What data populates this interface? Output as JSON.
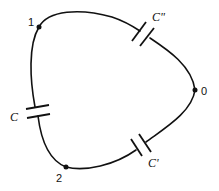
{
  "diagram": {
    "type": "capacitor-ring-circuit",
    "colors": {
      "stroke": "#111111",
      "background": "#ffffff"
    },
    "nodes": [
      {
        "id": "1",
        "label": "1"
      },
      {
        "id": "0",
        "label": "0"
      },
      {
        "id": "2",
        "label": "2"
      }
    ],
    "capacitors": [
      {
        "id": "C_double_prime",
        "label": "C\"",
        "between": [
          "1",
          "0"
        ]
      },
      {
        "id": "C_prime",
        "label": "C'",
        "between": [
          "0",
          "2"
        ]
      },
      {
        "id": "C",
        "label": "C",
        "between": [
          "2",
          "1"
        ]
      }
    ]
  }
}
